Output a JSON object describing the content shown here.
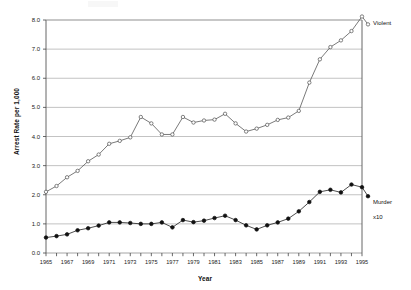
{
  "chart_data": {
    "type": "line",
    "title": "",
    "xlabel": "Year",
    "ylabel": "Arrest Rate per 1,000",
    "xlim": [
      1965,
      1995
    ],
    "ylim": [
      0.0,
      8.0
    ],
    "grid": true,
    "legend_position": "right-inline",
    "x": [
      1965,
      1966,
      1967,
      1968,
      1969,
      1970,
      1971,
      1972,
      1973,
      1974,
      1975,
      1976,
      1977,
      1978,
      1979,
      1980,
      1981,
      1982,
      1983,
      1984,
      1985,
      1986,
      1987,
      1988,
      1989,
      1990,
      1991,
      1992,
      1993,
      1994,
      1995
    ],
    "xtick_labels": [
      "1965",
      "1967",
      "1969",
      "1971",
      "1973",
      "1975",
      "1977",
      "1979",
      "1981",
      "1983",
      "1985",
      "1987",
      "1989",
      "1991",
      "1993",
      "1995"
    ],
    "ytick_labels": [
      "0.0",
      "1.0",
      "2.0",
      "3.0",
      "4.0",
      "5.0",
      "6.0",
      "7.0",
      "8.0"
    ],
    "ytick_values": [
      0.0,
      1.0,
      2.0,
      3.0,
      4.0,
      5.0,
      6.0,
      7.0,
      8.0
    ],
    "series": [
      {
        "name": "Violent",
        "label": "Violent",
        "marker": "open-circle",
        "color": "#4d4d4d",
        "values": [
          2.1,
          2.3,
          2.6,
          2.82,
          3.15,
          3.38,
          3.75,
          3.85,
          3.97,
          4.67,
          4.45,
          4.07,
          4.07,
          4.67,
          4.48,
          4.55,
          4.58,
          4.78,
          4.45,
          4.17,
          4.27,
          4.4,
          4.57,
          4.65,
          4.88,
          5.85,
          6.65,
          7.07,
          7.3,
          7.62,
          8.12
        ]
      },
      {
        "name": "Murder x10",
        "label": "Murder\nx10",
        "marker": "filled-circle",
        "color": "#111111",
        "values": [
          0.53,
          0.58,
          0.64,
          0.78,
          0.85,
          0.94,
          1.05,
          1.05,
          1.03,
          1.0,
          1.0,
          1.05,
          0.88,
          1.13,
          1.06,
          1.11,
          1.2,
          1.28,
          1.13,
          0.95,
          0.81,
          0.95,
          1.05,
          1.18,
          1.43,
          1.75,
          2.1,
          2.17,
          2.08,
          2.35,
          2.26
        ]
      }
    ],
    "trailing_points": {
      "violent_final": 7.85,
      "murder_final": 1.95
    }
  },
  "labels": {
    "violent": "Violent",
    "murder_line1": "Murder",
    "murder_line2": "x10"
  }
}
